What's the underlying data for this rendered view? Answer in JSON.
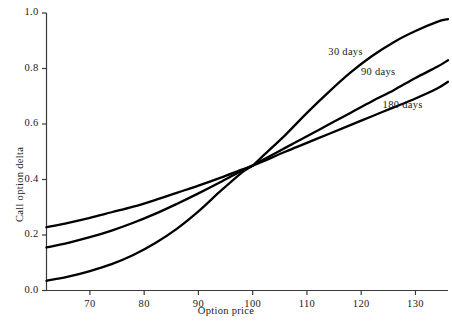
{
  "chart_data": {
    "type": "line",
    "title": "",
    "xlabel": "Option price",
    "ylabel": "Call option delta",
    "xlim": [
      62,
      136
    ],
    "ylim": [
      0.0,
      1.0
    ],
    "grid": false,
    "legend_position": "inline-right",
    "xticks": [
      70,
      80,
      90,
      100,
      110,
      120,
      130
    ],
    "xtick_labels": [
      "70",
      "80",
      "90",
      "100",
      "110",
      "120",
      "130"
    ],
    "yticks": [
      0.0,
      0.2,
      0.4,
      0.6,
      0.8,
      1.0
    ],
    "ytick_labels": [
      "0.0",
      "0.2",
      "0.4",
      "0.6",
      "0.8",
      "1.0"
    ],
    "x": [
      62,
      66,
      70,
      74,
      78,
      82,
      86,
      90,
      94,
      98,
      100,
      102,
      106,
      110,
      114,
      118,
      122,
      126,
      130,
      134,
      136
    ],
    "series": [
      {
        "name": "30 days",
        "label": "30 days",
        "color": "#000000",
        "values": [
          0.035,
          0.05,
          0.07,
          0.095,
          0.128,
          0.17,
          0.222,
          0.285,
          0.357,
          0.425,
          0.45,
          0.487,
          0.56,
          0.64,
          0.715,
          0.785,
          0.845,
          0.895,
          0.935,
          0.968,
          0.978
        ]
      },
      {
        "name": "90 days",
        "label": "90 days",
        "color": "#000000",
        "values": [
          0.155,
          0.172,
          0.192,
          0.216,
          0.244,
          0.276,
          0.312,
          0.35,
          0.39,
          0.432,
          0.45,
          0.472,
          0.514,
          0.556,
          0.598,
          0.64,
          0.682,
          0.722,
          0.766,
          0.806,
          0.83
        ]
      },
      {
        "name": "180 days",
        "label": "180 days",
        "color": "#000000",
        "values": [
          0.228,
          0.244,
          0.262,
          0.282,
          0.302,
          0.326,
          0.352,
          0.378,
          0.406,
          0.436,
          0.45,
          0.466,
          0.5,
          0.532,
          0.564,
          0.596,
          0.628,
          0.66,
          0.692,
          0.728,
          0.752
        ]
      }
    ],
    "annotations": [
      {
        "text": "30 days",
        "x": 118,
        "y": 0.855
      },
      {
        "text": "90 days",
        "x": 124,
        "y": 0.785
      },
      {
        "text": "180 days",
        "x": 128,
        "y": 0.665
      }
    ],
    "crossing_point": {
      "x": 100,
      "y": 0.45
    }
  }
}
